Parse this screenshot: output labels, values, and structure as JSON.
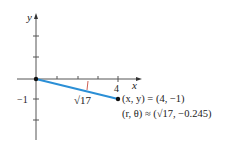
{
  "figure": {
    "axes": {
      "x_label": "x",
      "y_label": "y",
      "x_tick_label": "4",
      "y_tick_label": "−1"
    },
    "segment": {
      "label": "√17",
      "color": "#2b8fd6",
      "from": [
        0,
        0
      ],
      "to": [
        4,
        -1
      ]
    },
    "annotations": {
      "cartesian": "(x, y) = (4, −1)",
      "polar": "(r, θ) ≈ (√17, −0.245)"
    }
  }
}
